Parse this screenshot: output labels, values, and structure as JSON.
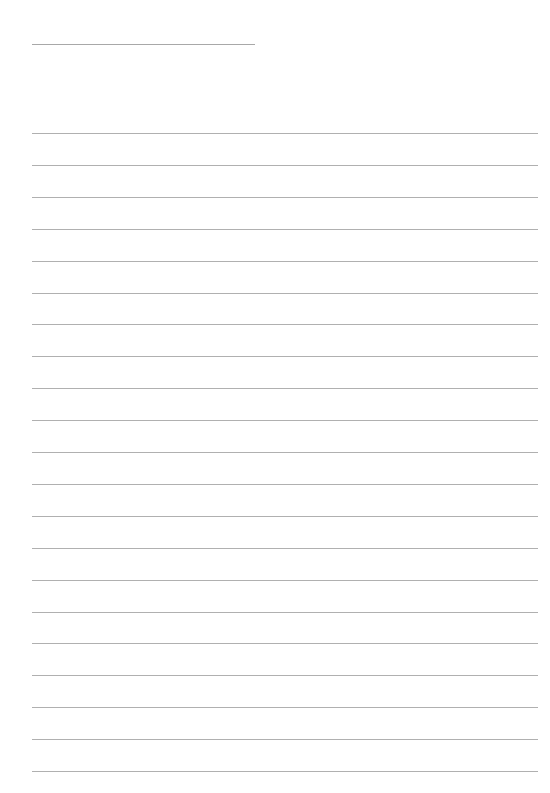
{
  "page": {
    "type": "lined-writing-sheet",
    "background_color": "#ffffff",
    "line_color": "#b0b0b0",
    "header_line": {
      "x": 32,
      "y": 44,
      "width": 223,
      "text": ""
    },
    "ruled_lines": {
      "count": 21,
      "x": 32,
      "width": 506,
      "first_y": 133,
      "spacing": 31.9,
      "entries": [
        "",
        "",
        "",
        "",
        "",
        "",
        "",
        "",
        "",
        "",
        "",
        "",
        "",
        "",
        "",
        "",
        "",
        "",
        "",
        "",
        ""
      ]
    }
  }
}
